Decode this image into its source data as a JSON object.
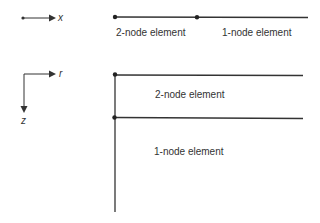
{
  "diagram": {
    "line_color": "#333333",
    "text_color": "#333333",
    "axial_system": {
      "axis_label": "x",
      "elements": [
        {
          "label": "2-node element"
        },
        {
          "label": "1-node element"
        }
      ]
    },
    "radial_system": {
      "axes": {
        "horizontal": "r",
        "vertical": "z"
      },
      "elements": [
        {
          "label": "2-node element"
        },
        {
          "label": "1-node element"
        }
      ]
    }
  }
}
